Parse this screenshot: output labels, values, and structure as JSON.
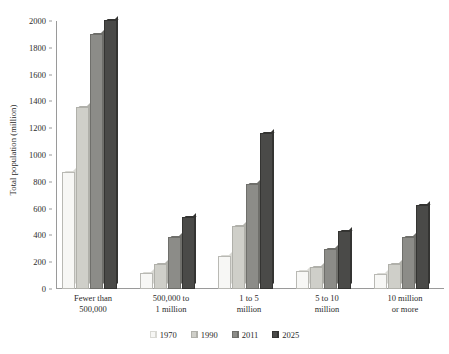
{
  "chart_data": {
    "type": "bar",
    "title": "",
    "xlabel": "",
    "ylabel": "Total population (million)",
    "ylim": [
      0,
      2000
    ],
    "ytick_step": 200,
    "yticks": [
      0,
      200,
      400,
      600,
      800,
      1000,
      1200,
      1400,
      1600,
      1800,
      2000
    ],
    "grid": false,
    "legend_position": "bottom",
    "categories": [
      "Fewer than 500,000",
      "500,000 to 1 million",
      "1 to 5 million",
      "5 to 10 million",
      "10 million or more"
    ],
    "category_lines": [
      [
        "Fewer than",
        "500,000"
      ],
      [
        "500,000 to",
        "1 million"
      ],
      [
        "1 to 5",
        "million"
      ],
      [
        "5 to 10",
        "million"
      ],
      [
        "10 million",
        "or more"
      ]
    ],
    "series": [
      {
        "name": "1970",
        "color": "#f7f7f5",
        "side_color": "#d9d9d4",
        "values": [
          860,
          105,
          235,
          120,
          95
        ]
      },
      {
        "name": "1990",
        "color": "#cfcfc9",
        "side_color": "#b0b0aa",
        "values": [
          1340,
          175,
          455,
          150,
          170
        ]
      },
      {
        "name": "2011",
        "color": "#8c8c88",
        "side_color": "#6f6f6b",
        "values": [
          1885,
          370,
          770,
          280,
          370
        ]
      },
      {
        "name": "2025",
        "color": "#4a4a48",
        "side_color": "#343432",
        "values": [
          1990,
          520,
          1150,
          415,
          615
        ]
      }
    ]
  },
  "axis": {
    "axis_color": "#9a9a9a"
  }
}
